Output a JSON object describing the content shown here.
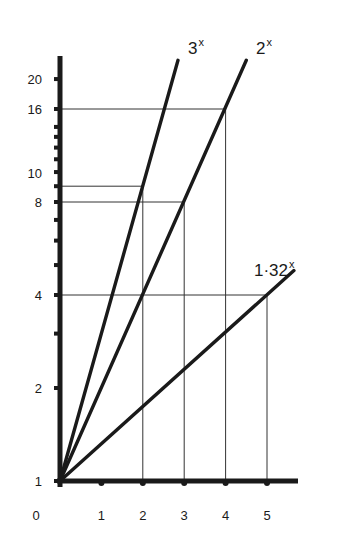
{
  "chart_data": {
    "type": "line",
    "title": "",
    "xlabel": "",
    "ylabel": "",
    "y_scale": "log",
    "xlim": [
      0,
      5.6
    ],
    "ylim": [
      1,
      23
    ],
    "grid": false,
    "x_ticks": [
      0,
      1,
      2,
      3,
      4,
      5
    ],
    "x_tick_labels": [
      "0",
      "1",
      "2",
      "3",
      "4",
      "5"
    ],
    "y_minor_ticks": [
      1,
      2,
      3,
      4,
      5,
      6,
      7,
      8,
      9,
      10,
      11,
      12,
      13,
      14,
      16,
      20
    ],
    "y_tick_labels": [
      {
        "value": 1,
        "label": "1"
      },
      {
        "value": 2,
        "label": "2"
      },
      {
        "value": 4,
        "label": "4"
      },
      {
        "value": 8,
        "label": "8"
      },
      {
        "value": 10,
        "label": "10"
      },
      {
        "value": 16,
        "label": "16"
      },
      {
        "value": 20,
        "label": "20"
      }
    ],
    "series": [
      {
        "name": "3^x",
        "label_base": "3",
        "label_exp": "x",
        "base": 3,
        "x": [
          0,
          1,
          2,
          2.85
        ],
        "values": [
          1,
          3,
          9,
          23
        ]
      },
      {
        "name": "2^x",
        "label_base": "2",
        "label_exp": "x",
        "base": 2,
        "x": [
          0,
          1,
          2,
          3,
          4,
          4.5
        ],
        "values": [
          1,
          2,
          4,
          8,
          16,
          23
        ]
      },
      {
        "name": "1.32^x",
        "label_base": "1·32",
        "label_exp": "x",
        "base": 1.32,
        "x": [
          0,
          1,
          2,
          3,
          4,
          5,
          5.65
        ],
        "values": [
          1,
          1.32,
          1.74,
          2.3,
          3.04,
          4.01,
          4.8
        ]
      }
    ],
    "guide_lines": [
      {
        "x": 2,
        "y": 9,
        "series": "3^x"
      },
      {
        "x": 3,
        "y": 8,
        "series": "2^x"
      },
      {
        "x": 4,
        "y": 16,
        "series": "2^x"
      },
      {
        "x": 5,
        "y": 4,
        "series": "1.32^x"
      }
    ],
    "annotations": [
      "3^x",
      "2^x",
      "1·32^x"
    ]
  },
  "colors": {
    "ink": "#1a1a1a",
    "guide": "#333333",
    "background": "#ffffff"
  }
}
